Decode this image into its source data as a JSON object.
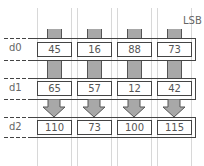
{
  "labels": {
    "lsb": "LSB"
  },
  "rows": [
    {
      "name": "d0",
      "values": [
        "45",
        "16",
        "88",
        "73"
      ]
    },
    {
      "name": "d1",
      "values": [
        "65",
        "57",
        "12",
        "42"
      ]
    },
    {
      "name": "d2",
      "values": [
        "110",
        "73",
        "100",
        "115"
      ]
    }
  ],
  "colors": {
    "bar_fill": "#a8a8a8",
    "line": "#444444",
    "guide": "#d8d8d8"
  }
}
